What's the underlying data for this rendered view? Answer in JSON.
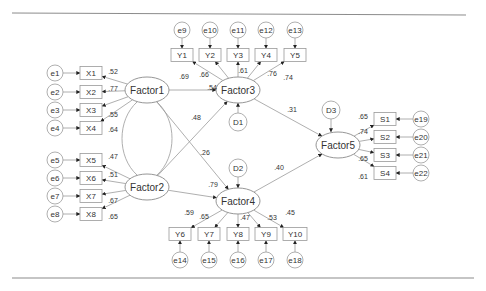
{
  "diagram": {
    "type": "structural-equation-model",
    "factors": [
      {
        "id": "Factor1",
        "label": "Factor1",
        "x": 147,
        "y": 90
      },
      {
        "id": "Factor2",
        "label": "Factor2",
        "x": 147,
        "y": 187
      },
      {
        "id": "Factor3",
        "label": "Factor3",
        "x": 238,
        "y": 90
      },
      {
        "id": "Factor4",
        "label": "Factor4",
        "x": 238,
        "y": 201
      },
      {
        "id": "Factor5",
        "label": "Factor5",
        "x": 338,
        "y": 145
      }
    ],
    "disturbances": [
      {
        "id": "D1",
        "label": "D1",
        "x": 238,
        "y": 122
      },
      {
        "id": "D2",
        "label": "D2",
        "x": 238,
        "y": 168
      },
      {
        "id": "D3",
        "label": "D3",
        "x": 331,
        "y": 110
      }
    ],
    "indicators": [
      {
        "id": "X1",
        "label": "X1",
        "x": 91,
        "y": 73,
        "error": "e1",
        "ex": 55,
        "ey": 73,
        "loading": ".52",
        "factor": "Factor1"
      },
      {
        "id": "X2",
        "label": "X2",
        "x": 91,
        "y": 92,
        "error": "e2",
        "ex": 55,
        "ey": 92,
        "loading": ".77",
        "factor": "Factor1"
      },
      {
        "id": "X3",
        "label": "X3",
        "x": 91,
        "y": 110,
        "error": "e3",
        "ex": 55,
        "ey": 110,
        "loading": ".55",
        "factor": "Factor1"
      },
      {
        "id": "X4",
        "label": "X4",
        "x": 91,
        "y": 128,
        "error": "e4",
        "ex": 55,
        "ey": 128,
        "loading": ".64",
        "factor": "Factor1"
      },
      {
        "id": "X5",
        "label": "X5",
        "x": 91,
        "y": 160,
        "error": "e5",
        "ex": 55,
        "ey": 160,
        "loading": ".47",
        "factor": "Factor2"
      },
      {
        "id": "X6",
        "label": "X6",
        "x": 91,
        "y": 178,
        "error": "e6",
        "ex": 55,
        "ey": 178,
        "loading": ".51",
        "factor": "Factor2"
      },
      {
        "id": "X7",
        "label": "X7",
        "x": 91,
        "y": 196,
        "error": "e7",
        "ex": 55,
        "ey": 196,
        "loading": ".67",
        "factor": "Factor2"
      },
      {
        "id": "X8",
        "label": "X8",
        "x": 91,
        "y": 214,
        "error": "e8",
        "ex": 55,
        "ey": 214,
        "loading": ".65",
        "factor": "Factor2"
      },
      {
        "id": "Y1",
        "label": "Y1",
        "x": 182,
        "y": 55,
        "error": "e9",
        "ex": 182,
        "ey": 30,
        "loading": ".69",
        "factor": "Factor3"
      },
      {
        "id": "Y2",
        "label": "Y2",
        "x": 210,
        "y": 55,
        "error": "e10",
        "ex": 210,
        "ey": 30,
        "loading": ".66",
        "factor": "Factor3"
      },
      {
        "id": "Y3",
        "label": "Y3",
        "x": 238,
        "y": 55,
        "error": "e11",
        "ex": 238,
        "ey": 30,
        "loading": ".61",
        "factor": "Factor3"
      },
      {
        "id": "Y4",
        "label": "Y4",
        "x": 266,
        "y": 55,
        "error": "e12",
        "ex": 266,
        "ey": 30,
        "loading": ".76",
        "factor": "Factor3"
      },
      {
        "id": "Y5",
        "label": "Y5",
        "x": 295,
        "y": 55,
        "error": "e13",
        "ex": 295,
        "ey": 30,
        "loading": ".74",
        "factor": "Factor3"
      },
      {
        "id": "Y6",
        "label": "Y6",
        "x": 180,
        "y": 234,
        "error": "e14",
        "ex": 180,
        "ey": 260,
        "loading": ".59",
        "factor": "Factor4"
      },
      {
        "id": "Y7",
        "label": "Y7",
        "x": 209,
        "y": 234,
        "error": "e15",
        "ex": 209,
        "ey": 260,
        "loading": ".65",
        "factor": "Factor4"
      },
      {
        "id": "Y8",
        "label": "Y8",
        "x": 238,
        "y": 234,
        "error": "e16",
        "ex": 238,
        "ey": 260,
        "loading": ".47",
        "factor": "Factor4"
      },
      {
        "id": "Y9",
        "label": "Y9",
        "x": 266,
        "y": 234,
        "error": "e17",
        "ex": 266,
        "ey": 260,
        "loading": ".53",
        "factor": "Factor4"
      },
      {
        "id": "Y10",
        "label": "Y10",
        "x": 295,
        "y": 234,
        "error": "e18",
        "ex": 295,
        "ey": 260,
        "loading": ".45",
        "factor": "Factor4"
      },
      {
        "id": "S1",
        "label": "S1",
        "x": 385,
        "y": 119,
        "error": "e19",
        "ex": 421,
        "ey": 119,
        "loading": ".65",
        "factor": "Factor5"
      },
      {
        "id": "S2",
        "label": "S2",
        "x": 385,
        "y": 137,
        "error": "e20",
        "ex": 421,
        "ey": 137,
        "loading": ".74",
        "factor": "Factor5"
      },
      {
        "id": "S3",
        "label": "S3",
        "x": 385,
        "y": 155,
        "error": "e21",
        "ex": 421,
        "ey": 155,
        "loading": ".65",
        "factor": "Factor5"
      },
      {
        "id": "S4",
        "label": "S4",
        "x": 385,
        "y": 173,
        "error": "e22",
        "ex": 421,
        "ey": 173,
        "loading": ".61",
        "factor": "Factor5"
      }
    ],
    "structural_paths": [
      {
        "from": "Factor1",
        "to": "Factor3",
        "coef": ".54"
      },
      {
        "from": "Factor2",
        "to": "Factor3",
        "coef": ".48"
      },
      {
        "from": "Factor1",
        "to": "Factor4",
        "coef": ".26"
      },
      {
        "from": "Factor2",
        "to": "Factor4",
        "coef": ".79"
      },
      {
        "from": "Factor3",
        "to": "Factor5",
        "coef": ".31"
      },
      {
        "from": "Factor4",
        "to": "Factor5",
        "coef": ".40"
      }
    ],
    "covariances": [
      {
        "between": [
          "Factor1",
          "Factor2"
        ]
      }
    ]
  }
}
